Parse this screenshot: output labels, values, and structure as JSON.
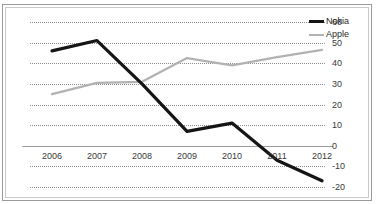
{
  "title_sliver": "",
  "legend": {
    "position": "top-right",
    "entries": [
      {
        "label": "Nokia",
        "color": "#151515",
        "swatch": "thick-black-line"
      },
      {
        "label": "Apple",
        "color": "#b2b2b2",
        "swatch": "gray-line"
      }
    ]
  },
  "axis": {
    "y_ticks": [
      "60",
      "50",
      "40",
      "30",
      "20",
      "10",
      "0",
      "-10",
      "-20"
    ],
    "x_ticks": [
      "2006",
      "2007",
      "2008",
      "2009",
      "2010",
      "2011",
      "2012"
    ]
  },
  "chart_data": {
    "type": "line",
    "title": "",
    "xlabel": "",
    "ylabel": "",
    "x": [
      "2006",
      "2007",
      "2008",
      "2009",
      "2010",
      "2011",
      "2012"
    ],
    "categories": [
      "2006",
      "2007",
      "2008",
      "2009",
      "2010",
      "2011",
      "2012"
    ],
    "series": [
      {
        "name": "Nokia",
        "color": "#151515",
        "values": [
          46,
          51,
          30,
          7,
          11,
          -7,
          -17
        ]
      },
      {
        "name": "Apple",
        "color": "#b2b2b2",
        "values": [
          25,
          30.5,
          31,
          42.5,
          39,
          43,
          46.5
        ]
      }
    ],
    "ylim": [
      -20,
      60
    ],
    "ytick_step": 10,
    "grid": true,
    "gridlines": [
      60,
      50,
      40,
      30,
      20,
      10,
      -10,
      -20
    ],
    "zero_axis": 0,
    "legend_position": "top-right",
    "y_axis_side": "right"
  }
}
